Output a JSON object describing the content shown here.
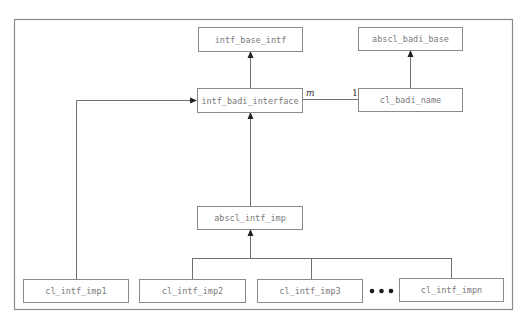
{
  "diagram": {
    "type": "uml-class-diagram",
    "nodes": [
      {
        "id": "intf_base_intf",
        "label": "intf_base_intf"
      },
      {
        "id": "abscl_badi_base",
        "label": "abscl_badi_base"
      },
      {
        "id": "intf_badi_interface",
        "label": "intf_badi_interface"
      },
      {
        "id": "cl_badi_name",
        "label": "cl_badi_name"
      },
      {
        "id": "abscl_intf_imp",
        "label": "abscl_intf_imp"
      },
      {
        "id": "cl_intf_imp1",
        "label": "cl_intf_imp1"
      },
      {
        "id": "cl_intf_imp2",
        "label": "cl_intf_imp2"
      },
      {
        "id": "cl_intf_imp3",
        "label": "cl_intf_imp3"
      },
      {
        "id": "cl_intf_impn",
        "label": "cl_intf_impn"
      }
    ],
    "edges": [
      {
        "from": "intf_badi_interface",
        "to": "intf_base_intf",
        "kind": "inheritance"
      },
      {
        "from": "cl_badi_name",
        "to": "abscl_badi_base",
        "kind": "inheritance"
      },
      {
        "from": "intf_badi_interface",
        "to": "cl_badi_name",
        "kind": "association",
        "from_multiplicity": "m",
        "to_multiplicity": "1"
      },
      {
        "from": "abscl_intf_imp",
        "to": "intf_badi_interface",
        "kind": "implementation"
      },
      {
        "from": "cl_intf_imp1",
        "to": "intf_badi_interface",
        "kind": "implementation"
      },
      {
        "from": "cl_intf_imp2",
        "to": "abscl_intf_imp",
        "kind": "inheritance"
      },
      {
        "from": "cl_intf_imp3",
        "to": "abscl_intf_imp",
        "kind": "inheritance"
      },
      {
        "from": "cl_intf_impn",
        "to": "abscl_intf_imp",
        "kind": "inheritance"
      }
    ],
    "multiplicity_m": "m",
    "multiplicity_1": "1",
    "ellipsis": "..."
  }
}
